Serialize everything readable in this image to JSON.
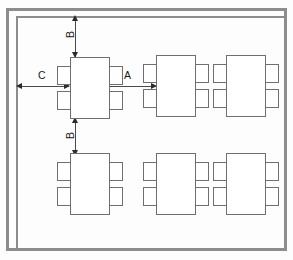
{
  "diagram": {
    "room": {
      "wall_style": "double-line-wall"
    },
    "dimensions": [
      {
        "id": "A",
        "label": "A",
        "orientation": "horizontal",
        "arrow": "double",
        "meaning": "horizontal clearance between adjacent tables"
      },
      {
        "id": "B-top",
        "label": "B",
        "orientation": "vertical",
        "arrow": "double",
        "meaning": "clearance from table to top wall"
      },
      {
        "id": "B-bottom",
        "label": "B",
        "orientation": "vertical",
        "arrow": "double",
        "meaning": "vertical clearance between table rows"
      },
      {
        "id": "C",
        "label": "C",
        "orientation": "horizontal",
        "arrow": "double",
        "meaning": "clearance from table to left wall"
      }
    ],
    "tables": [
      {
        "id": "table-r1-c1",
        "row": 1,
        "col": 1,
        "seats": 4
      },
      {
        "id": "table-r1-c2",
        "row": 1,
        "col": 2,
        "seats": 4
      },
      {
        "id": "table-r1-c3",
        "row": 1,
        "col": 3,
        "seats": 4
      },
      {
        "id": "table-r2-c1",
        "row": 2,
        "col": 1,
        "seats": 4
      },
      {
        "id": "table-r2-c2",
        "row": 2,
        "col": 2,
        "seats": 4
      },
      {
        "id": "table-r2-c3",
        "row": 2,
        "col": 3,
        "seats": 4
      }
    ],
    "colors": {
      "wall": "#8d8d8d",
      "furniture_stroke": "#6f6f6f",
      "dimension_line": "#4a4a4a",
      "label_text": "#1a1a1a",
      "background": "#fdfdfd"
    }
  }
}
